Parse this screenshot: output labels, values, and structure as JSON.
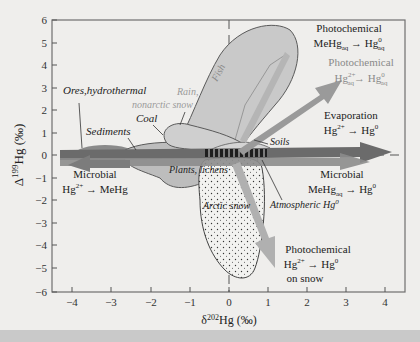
{
  "figure": {
    "x_axis": {
      "label_prefix": "δ",
      "label_sup": "202",
      "label_main": "Hg (‰)",
      "ticks": [
        "−4",
        "−3",
        "−2",
        "−1",
        "0",
        "1",
        "2",
        "3",
        "4"
      ]
    },
    "y_axis": {
      "label_prefix": "Δ",
      "label_sup": "199",
      "label_main": "Hg (‰)",
      "ticks": [
        "6",
        "5",
        "4",
        "3",
        "2",
        "1",
        "0",
        "−1",
        "−2",
        "−3",
        "−4",
        "−5",
        "−6"
      ]
    },
    "regions": {
      "fish": "Fish",
      "rain": "Rain,",
      "rain2": "nonarctic snow",
      "ores": "Ores,hydrothermal",
      "coal": "Coal",
      "sediments": "Sediments",
      "soils": "Soils",
      "plants": "Plants, lichens",
      "arctic_snow": "Arctic snow",
      "atmospheric": "Atmospheric Hg",
      "atmospheric_sup": "0"
    },
    "processes": {
      "photo_mehg_title": "Photochemical",
      "photo_mehg_eq": "MeHg",
      "photo_mehg_sub": "aq",
      "photo_mehg_arrow": " → Hg",
      "photo_mehg_sup": "0",
      "photo_mehg_sub2": "aq",
      "photo_hg_title": "Photochemical",
      "photo_hg_eq": "Hg",
      "photo_hg_sup": "2+",
      "photo_hg_sub": "aq",
      "photo_hg_arrow": "→ Hg",
      "photo_hg_sup2": "0",
      "photo_hg_sub2": "aq",
      "evap_title": "Evaporation",
      "evap_eq": "Hg",
      "evap_sup": "2+",
      "evap_arrow": " → Hg",
      "evap_sup2": "0",
      "micro_mehg_title": "Microbial",
      "micro_mehg_eq": "MeHg",
      "micro_mehg_sub": "aq",
      "micro_mehg_arrow": " → Hg",
      "micro_mehg_sup": "0",
      "micro_hg_title": "Microbial",
      "micro_hg_eq": "Hg",
      "micro_hg_sup": "2+",
      "micro_hg_arrow": " → MeHg",
      "photo_snow_title": "Photochemical",
      "photo_snow_eq": "Hg",
      "photo_snow_sup": "2+",
      "photo_snow_arrow": " → Hg",
      "photo_snow_sup2": "0",
      "photo_snow_line3": "on snow"
    },
    "colors": {
      "background": "#efeeec",
      "frame": "#6f6f6f",
      "fish_fill": "#c9c9c9",
      "region_fill": "#bdbdbd",
      "sediment_fill": "#8a8a8a",
      "dark_arrow": "#6b6b6b",
      "mid_arrow": "#8c8c8c",
      "light_arrow": "#a9a9a9",
      "light_text": "#9a9a9a"
    }
  }
}
